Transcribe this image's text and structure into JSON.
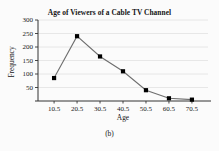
{
  "figure": {
    "caption": "(b)",
    "background_color": "#fbfbfb"
  },
  "chart_data": {
    "type": "line",
    "title": "Age of Viewers of a Cable TV Channel",
    "xlabel": "Age",
    "ylabel": "Frequency",
    "x": [
      10.5,
      20.5,
      30.5,
      40.5,
      50.5,
      60.5,
      70.5
    ],
    "values": [
      85,
      240,
      165,
      110,
      40,
      10,
      5
    ],
    "categories": [
      "10.5",
      "20.5",
      "30.5",
      "40.5",
      "50.5",
      "60.5",
      "70.5"
    ],
    "xtick_labels": [
      "10.5",
      "20.5",
      "30.5",
      "40.5",
      "50.5",
      "60.5",
      "70.5"
    ],
    "ytick_labels": [
      "50",
      "100",
      "150",
      "200",
      "250",
      "300"
    ],
    "ytick_values": [
      50,
      100,
      150,
      200,
      250,
      300
    ],
    "ylim": [
      0,
      300
    ],
    "xlim": [
      3.5,
      77.5
    ],
    "grid": true,
    "legend": "none",
    "line_color": "#6e6e6e",
    "marker_color": "#000000",
    "marker_shape": "square",
    "grid_color": "#e2e2e2",
    "axis_color": "#333333"
  },
  "axis_labels": {
    "x": "Age",
    "y": "Frequency"
  }
}
